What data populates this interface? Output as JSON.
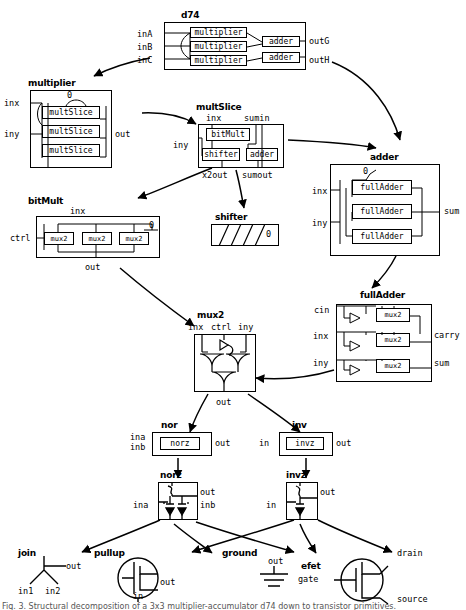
{
  "figure": {
    "type": "hierarchical-circuit-block-diagram",
    "caption": "Fig. 3. Structural decomposition of a 3x3 multiplier-accumulator d74 down to transistor primitives."
  },
  "modules": [
    {
      "id": "d74",
      "title": "d74",
      "inputs": [
        "inA",
        "inB",
        "inC"
      ],
      "outputs": [
        "outG",
        "outH"
      ],
      "children": [
        "multiplier",
        "multiplier",
        "multiplier",
        "adder",
        "adder"
      ],
      "child_labels": [
        "multiplier",
        "adder"
      ]
    },
    {
      "id": "multiplier",
      "title": "multiplier",
      "inputs": [
        "inx",
        "iny"
      ],
      "outputs": [
        "out"
      ],
      "constants": [
        "0"
      ],
      "child_labels": [
        "multSlice"
      ],
      "child_count": 3
    },
    {
      "id": "multSlice",
      "title": "multSlice",
      "inputs": [
        "inx",
        "sumin",
        "iny"
      ],
      "outputs": [
        "x2out",
        "sumout"
      ],
      "child_labels": [
        "bitMult",
        "shifter",
        "adder"
      ]
    },
    {
      "id": "bitMult",
      "title": "bitMult",
      "inputs": [
        "inx",
        "ctrl"
      ],
      "outputs": [
        "out"
      ],
      "constants": [
        "0"
      ],
      "child_labels": [
        "mux2"
      ],
      "child_count": 3
    },
    {
      "id": "shifter",
      "title": "shifter",
      "inputs": [],
      "outputs": [],
      "constants": [
        "0"
      ]
    },
    {
      "id": "adder",
      "title": "adder",
      "inputs": [
        "inx",
        "iny"
      ],
      "outputs": [
        "sum"
      ],
      "constants": [
        "0"
      ],
      "child_labels": [
        "fullAdder"
      ],
      "child_count": 3
    },
    {
      "id": "fullAdder",
      "title": "fullAdder",
      "inputs": [
        "cin",
        "inx",
        "iny"
      ],
      "outputs": [
        "carry",
        "sum"
      ],
      "child_labels": [
        "mux2"
      ],
      "child_count": 3
    },
    {
      "id": "mux2",
      "title": "mux2",
      "inputs": [
        "inx",
        "ctrl",
        "iny"
      ],
      "outputs": [
        "out"
      ]
    },
    {
      "id": "nor",
      "title": "nor",
      "inputs": [
        "ina",
        "inb"
      ],
      "outputs": [
        "out"
      ],
      "child_labels": [
        "norz"
      ]
    },
    {
      "id": "inv",
      "title": "inv",
      "inputs": [
        "in"
      ],
      "outputs": [
        "out"
      ],
      "child_labels": [
        "invz"
      ]
    },
    {
      "id": "norz",
      "title": "norz",
      "inputs": [
        "ina",
        "inb"
      ],
      "outputs": [
        "out"
      ]
    },
    {
      "id": "invz",
      "title": "invz",
      "inputs": [
        "in"
      ],
      "outputs": [
        "out"
      ]
    },
    {
      "id": "join",
      "title": "join",
      "inputs": [
        "in1",
        "in2"
      ],
      "outputs": [
        "out"
      ]
    },
    {
      "id": "pullup",
      "title": "pullup",
      "inputs": [
        "in"
      ],
      "outputs": [
        "out"
      ]
    },
    {
      "id": "ground",
      "title": "ground",
      "inputs": [],
      "outputs": [
        "out"
      ]
    },
    {
      "id": "efet",
      "title": "efet",
      "inputs": [
        "gate"
      ],
      "outputs": [
        "drain",
        "source"
      ]
    }
  ],
  "labels": {
    "d74": "d74",
    "d74_inA": "inA",
    "d74_inB": "inB",
    "d74_inC": "inC",
    "d74_outG": "outG",
    "d74_outH": "outH",
    "multiplier_child": "multiplier",
    "adder_child": "adder",
    "multiplier": "multiplier",
    "multiplier_inx": "inx",
    "multiplier_iny": "iny",
    "multiplier_out": "out",
    "multiplier_zero": "0",
    "multSlice_child": "multSlice",
    "multSlice": "multSlice",
    "multSlice_inx": "inx",
    "multSlice_sumin": "sumin",
    "multSlice_iny": "iny",
    "multSlice_x2out": "x2out",
    "multSlice_sumout": "sumout",
    "bitMult_child": "bitMult",
    "shifter_child": "shifter",
    "adder_child2": "adder",
    "bitMult": "bitMult",
    "bitMult_inx": "inx",
    "bitMult_ctrl": "ctrl",
    "bitMult_out": "out",
    "bitMult_zero": "0",
    "mux2_child": "mux2",
    "shifter": "shifter",
    "shifter_zero": "0",
    "adder": "adder",
    "adder_inx": "inx",
    "adder_iny": "iny",
    "adder_sum": "sum",
    "adder_zero": "0",
    "fullAdder_child": "fullAdder",
    "fullAdder": "fullAdder",
    "fullAdder_cin": "cin",
    "fullAdder_inx": "inx",
    "fullAdder_iny": "iny",
    "fullAdder_carry": "carry",
    "fullAdder_sum": "sum",
    "mux2": "mux2",
    "mux2_inx": "inx",
    "mux2_ctrl": "ctrl",
    "mux2_iny": "iny",
    "mux2_out": "out",
    "nor": "nor",
    "nor_ina": "ina",
    "nor_inb": "inb",
    "nor_out": "out",
    "norz_child": "norz",
    "inv": "inv",
    "inv_in": "in",
    "inv_out": "out",
    "invz_child": "invz",
    "norz": "norz",
    "norz_ina": "ina",
    "norz_inb": "inb",
    "norz_out": "out",
    "invz": "invz",
    "invz_in": "in",
    "invz_out": "out",
    "join": "join",
    "join_in1": "in1",
    "join_in2": "in2",
    "join_out": "out",
    "pullup": "pullup",
    "pullup_in": "in",
    "pullup_out": "out",
    "ground": "ground",
    "ground_out": "out",
    "efet": "efet",
    "efet_gate": "gate",
    "efet_drain": "drain",
    "efet_source": "source"
  },
  "colors": {
    "line": "#000000",
    "background": "#ffffff",
    "text": "#000000"
  }
}
